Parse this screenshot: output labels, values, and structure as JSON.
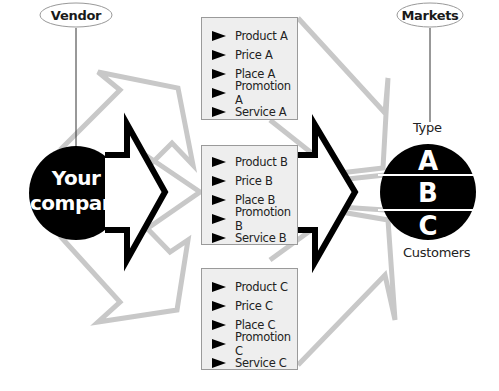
{
  "diagram": {
    "vendor_label": "Vendor",
    "markets_label": "Markets",
    "company": {
      "line1": "Your",
      "line2": "company"
    },
    "market_segments": {
      "top_label": "Type",
      "bottom_label": "Customers",
      "segments": [
        "A",
        "B",
        "C"
      ]
    },
    "offers": [
      {
        "id": "A",
        "items": [
          "Product A",
          "Price A",
          "Place A",
          "Promotion A",
          "Service A"
        ]
      },
      {
        "id": "B",
        "items": [
          "Product B",
          "Price B",
          "Place B",
          "Promotion B",
          "Service B"
        ]
      },
      {
        "id": "C",
        "items": [
          "Product C",
          "Price C",
          "Place C",
          "Promotion C",
          "Service C"
        ]
      }
    ],
    "colors": {
      "gray_arrow": "#c8c8c8",
      "black": "#000000",
      "box_fill": "#eeeeee",
      "box_border": "#9a9a9a"
    }
  }
}
